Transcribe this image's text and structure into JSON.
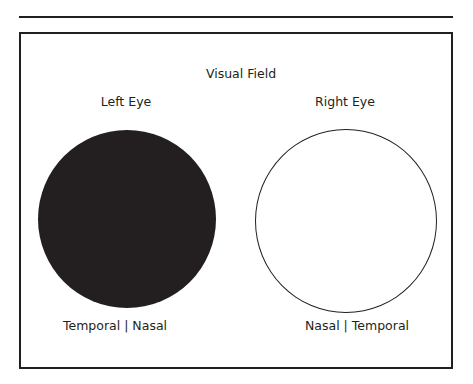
{
  "diagram": {
    "title": "Visual Field",
    "left_eye": {
      "label": "Left Eye",
      "state": "filled",
      "fill_color": "#231f20",
      "axis_label": "Temporal | Nasal"
    },
    "right_eye": {
      "label": "Right Eye",
      "state": "empty",
      "fill_color": "#ffffff",
      "axis_label": "Nasal | Temporal"
    }
  }
}
